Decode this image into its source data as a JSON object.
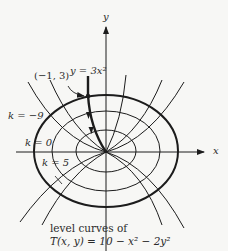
{
  "figure": {
    "axes": {
      "x_label": "x",
      "y_label": "y"
    },
    "labels": {
      "point": "(−1, 3)",
      "curve": "y = 3x²",
      "k_neg9": "k = −9",
      "k_0": "k = 0",
      "k_5": "k = 5",
      "caption_line1": "level curves of",
      "caption_line2": "T(x, y) = 10 − x² − 2y²"
    },
    "level_curves": [
      {
        "k": -9,
        "style": "thick"
      },
      {
        "k": 0,
        "style": "normal"
      },
      {
        "k": 5,
        "style": "normal"
      }
    ],
    "highlighted_path": {
      "equation": "y = 3x²",
      "start_point": "(−1, 3)",
      "direction": "toward origin"
    },
    "colors": {
      "ink": "#1c1c1c",
      "background": "#f7f7f5"
    }
  }
}
